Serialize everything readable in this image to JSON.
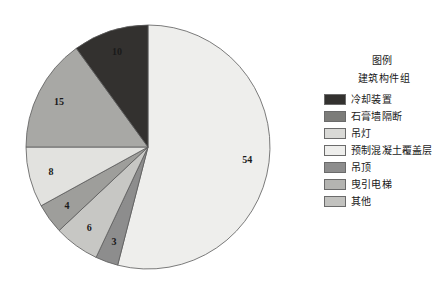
{
  "chart_data": {
    "type": "pie",
    "title": "",
    "legend_title": "图例",
    "legend_subtitle": "建筑构件组",
    "legend_position": "right",
    "start_angle_deg": 0,
    "direction": "clockwise",
    "categories": [
      "预制混凝土覆盖层",
      "吊顶",
      "曳引电梯",
      "其他",
      "吊灯",
      "石膏墙隔断",
      "冷却装置"
    ],
    "values": [
      54,
      3,
      6,
      4,
      8,
      15,
      10
    ],
    "total": 100,
    "slices": [
      {
        "label": "预制混凝土覆盖层",
        "value": 54,
        "display": "54",
        "color": "#eeeeec",
        "label_color": "#1a1a1a"
      },
      {
        "label": "吊顶",
        "value": 3,
        "display": "3",
        "color": "#8d8d8d",
        "label_color": "#1a1a1a"
      },
      {
        "label": "曳引电梯",
        "value": 6,
        "display": "6",
        "color": "#c7c7c4",
        "label_color": "#1a1a1a"
      },
      {
        "label": "其他",
        "value": 4,
        "display": "4",
        "color": "#9e9e9b",
        "label_color": "#1a1a1a"
      },
      {
        "label": "吊灯",
        "value": 8,
        "display": "8",
        "color": "#e2e2df",
        "label_color": "#1a1a1a"
      },
      {
        "label": "石膏墙隔断",
        "value": 15,
        "display": "15",
        "color": "#a8a8a5",
        "label_color": "#1a1a1a"
      },
      {
        "label": "冷却装置",
        "value": 10,
        "display": "10",
        "color": "#33312f",
        "label_color": "#f2f2f2"
      }
    ],
    "legend_entries": [
      {
        "label": "冷却装置",
        "color": "#33312f"
      },
      {
        "label": "石膏墙隔断",
        "color": "#7c7c79"
      },
      {
        "label": "吊灯",
        "color": "#d9d9d6"
      },
      {
        "label": "预制混凝土覆盖层",
        "color": "#eeeeec"
      },
      {
        "label": "吊顶",
        "color": "#8d8d8d"
      },
      {
        "label": "曳引电梯",
        "color": "#b4b4b1"
      },
      {
        "label": "其他",
        "color": "#c2c2bf"
      }
    ]
  }
}
